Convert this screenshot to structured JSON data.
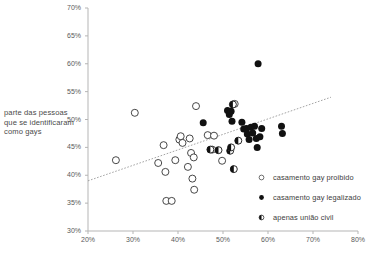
{
  "chart_data": {
    "type": "scatter",
    "title": "",
    "xlabel": "",
    "ylabel": "parte das pessoas que se identificaram como gays",
    "xlim": [
      20,
      80
    ],
    "ylim": [
      30,
      70
    ],
    "xticks": [
      "20%",
      "30%",
      "40%",
      "50%",
      "60%",
      "70%",
      "80%"
    ],
    "xtick_values": [
      20,
      30,
      40,
      50,
      60,
      70,
      80
    ],
    "yticks": [
      "30%",
      "35%",
      "40%",
      "45%",
      "50%",
      "55%",
      "60%",
      "65%",
      "70%"
    ],
    "ytick_values": [
      30,
      35,
      40,
      45,
      50,
      55,
      60,
      65,
      70
    ],
    "grid": false,
    "legend_position": "bottom-right",
    "marker_colors": {
      "hollow_stroke": "#333333",
      "hollow_fill": "#ffffff",
      "filled": "#111111",
      "half": "#111111",
      "axis": "#b5b5b5",
      "trendline": "#9a9a9a"
    },
    "trendline": {
      "x": [
        20,
        74
      ],
      "y": [
        39.0,
        54.0
      ],
      "style": "dotted"
    },
    "series": [
      {
        "name": "casamento gay proibido",
        "marker": "hollow-circle",
        "points": [
          [
            26.2,
            42.7
          ],
          [
            30.4,
            51.2
          ],
          [
            35.6,
            42.2
          ],
          [
            36.8,
            45.4
          ],
          [
            37.2,
            40.6
          ],
          [
            37.4,
            35.4
          ],
          [
            38.6,
            35.4
          ],
          [
            39.4,
            42.7
          ],
          [
            40.3,
            46.4
          ],
          [
            40.6,
            47.0
          ],
          [
            41.0,
            45.8
          ],
          [
            42.2,
            41.5
          ],
          [
            42.6,
            46.6
          ],
          [
            42.9,
            44.0
          ],
          [
            43.2,
            39.4
          ],
          [
            43.5,
            43.2
          ],
          [
            43.6,
            37.4
          ],
          [
            44.0,
            52.4
          ],
          [
            46.6,
            47.2
          ],
          [
            47.6,
            44.6
          ],
          [
            48.0,
            47.1
          ],
          [
            49.8,
            42.6
          ],
          [
            52.6,
            52.8
          ]
        ]
      },
      {
        "name": "casamento gay legalizado",
        "marker": "filled-circle",
        "points": [
          [
            45.6,
            49.4
          ],
          [
            51.0,
            51.6
          ],
          [
            51.4,
            50.9
          ],
          [
            51.8,
            51.5
          ],
          [
            52.0,
            49.7
          ],
          [
            54.2,
            49.5
          ],
          [
            54.6,
            48.3
          ],
          [
            55.2,
            48.4
          ],
          [
            55.4,
            47.4
          ],
          [
            55.8,
            46.4
          ],
          [
            56.2,
            48.6
          ],
          [
            56.6,
            47.6
          ],
          [
            57.0,
            48.8
          ],
          [
            57.4,
            46.6
          ],
          [
            57.6,
            45.0
          ],
          [
            57.8,
            60.0
          ],
          [
            58.2,
            46.9
          ],
          [
            58.6,
            48.4
          ],
          [
            63.0,
            48.8
          ],
          [
            63.2,
            47.5
          ]
        ]
      },
      {
        "name": "apenas união civil",
        "marker": "half-filled-circle",
        "points": [
          [
            52.2,
            52.7
          ],
          [
            51.6,
            44.4
          ],
          [
            51.8,
            45.0
          ],
          [
            52.4,
            41.1
          ],
          [
            53.4,
            46.2
          ],
          [
            49.0,
            44.5
          ],
          [
            47.2,
            44.6
          ]
        ]
      }
    ]
  }
}
